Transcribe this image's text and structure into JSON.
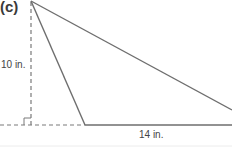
{
  "figure": {
    "part_label": "(c)",
    "shape": "triangle",
    "height_label": "10 in.",
    "base_label": "14 in.",
    "height_value": 10,
    "base_value": 14,
    "unit": "in.",
    "right_angle_marker": true,
    "colors": {
      "solid_line": "#6e6e6e",
      "dashed_line": "#7a7a7a",
      "text": "#444444",
      "bottom_rule": "#ececec"
    }
  }
}
